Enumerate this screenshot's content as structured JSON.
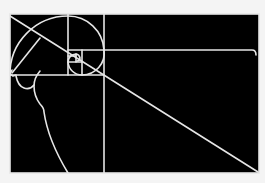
{
  "diagram": {
    "colors": {
      "background": "#f4f4f4",
      "fill": "#000000",
      "stroke": "#e6e6e6"
    },
    "frame": {
      "x": 10,
      "y": 14,
      "width": 249,
      "height": 159
    },
    "subdivisions": {
      "vertical_lines_x": [
        68,
        104,
        82
      ],
      "horizontal_lines_y": [
        50,
        75,
        62
      ]
    },
    "elements": [
      "outer-frame",
      "golden-rectangle-subdivisions",
      "golden-spiral",
      "diagonal-line",
      "face-profile"
    ]
  }
}
